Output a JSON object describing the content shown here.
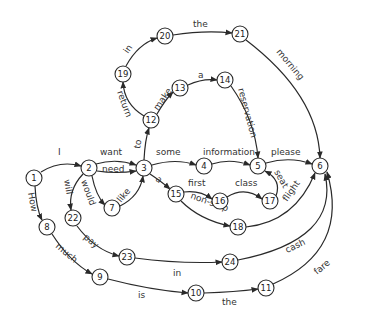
{
  "diagram": {
    "nodes": [
      {
        "id": "1",
        "x": 34,
        "y": 178
      },
      {
        "id": "2",
        "x": 89,
        "y": 168
      },
      {
        "id": "3",
        "x": 144,
        "y": 168
      },
      {
        "id": "4",
        "x": 204,
        "y": 166
      },
      {
        "id": "5",
        "x": 258,
        "y": 166
      },
      {
        "id": "6",
        "x": 320,
        "y": 166
      },
      {
        "id": "7",
        "x": 112,
        "y": 208
      },
      {
        "id": "8",
        "x": 47,
        "y": 227
      },
      {
        "id": "9",
        "x": 100,
        "y": 277
      },
      {
        "id": "10",
        "x": 196,
        "y": 293
      },
      {
        "id": "11",
        "x": 266,
        "y": 288
      },
      {
        "id": "12",
        "x": 151,
        "y": 120
      },
      {
        "id": "13",
        "x": 180,
        "y": 88
      },
      {
        "id": "14",
        "x": 225,
        "y": 80
      },
      {
        "id": "15",
        "x": 176,
        "y": 194
      },
      {
        "id": "16",
        "x": 220,
        "y": 201
      },
      {
        "id": "17",
        "x": 270,
        "y": 201
      },
      {
        "id": "18",
        "x": 238,
        "y": 227
      },
      {
        "id": "19",
        "x": 123,
        "y": 74
      },
      {
        "id": "20",
        "x": 165,
        "y": 36
      },
      {
        "id": "21",
        "x": 240,
        "y": 34
      },
      {
        "id": "22",
        "x": 73,
        "y": 218
      },
      {
        "id": "23",
        "x": 127,
        "y": 257
      },
      {
        "id": "24",
        "x": 230,
        "y": 262
      }
    ],
    "edges": [
      {
        "from": "1",
        "to": "2",
        "label": "I"
      },
      {
        "from": "2",
        "to": "3",
        "label": "want"
      },
      {
        "from": "2",
        "to": "3",
        "label": "need"
      },
      {
        "from": "2",
        "to": "7",
        "label": "would"
      },
      {
        "from": "7",
        "to": "3",
        "label": "like"
      },
      {
        "from": "2",
        "to": "22",
        "label": "will"
      },
      {
        "from": "3",
        "to": "4",
        "label": "some"
      },
      {
        "from": "4",
        "to": "5",
        "label": "information"
      },
      {
        "from": "5",
        "to": "6",
        "label": "please"
      },
      {
        "from": "3",
        "to": "12",
        "label": "to"
      },
      {
        "from": "12",
        "to": "13",
        "label": "make"
      },
      {
        "from": "13",
        "to": "14",
        "label": "a"
      },
      {
        "from": "14",
        "to": "5",
        "label": "reservation"
      },
      {
        "from": "12",
        "to": "19",
        "label": "return"
      },
      {
        "from": "19",
        "to": "20",
        "label": "in"
      },
      {
        "from": "20",
        "to": "21",
        "label": "the"
      },
      {
        "from": "21",
        "to": "6",
        "label": "morning"
      },
      {
        "from": "3",
        "to": "15",
        "label": "a"
      },
      {
        "from": "15",
        "to": "16",
        "label": "first"
      },
      {
        "from": "16",
        "to": "17",
        "label": "class"
      },
      {
        "from": "17",
        "to": "5",
        "label": "seat"
      },
      {
        "from": "15",
        "to": "18",
        "label": "non-stop"
      },
      {
        "from": "18",
        "to": "6",
        "label": "flight"
      },
      {
        "from": "1",
        "to": "8",
        "label": "How"
      },
      {
        "from": "8",
        "to": "9",
        "label": "much"
      },
      {
        "from": "9",
        "to": "10",
        "label": "is"
      },
      {
        "from": "10",
        "to": "11",
        "label": "the"
      },
      {
        "from": "11",
        "to": "6",
        "label": "fare"
      },
      {
        "from": "22",
        "to": "23",
        "label": "pay"
      },
      {
        "from": "23",
        "to": "24",
        "label": "in"
      },
      {
        "from": "24",
        "to": "6",
        "label": "cash"
      }
    ],
    "colors": {
      "stroke": "#2a2a2a",
      "background": "#ffffff",
      "text": "#333333"
    }
  }
}
